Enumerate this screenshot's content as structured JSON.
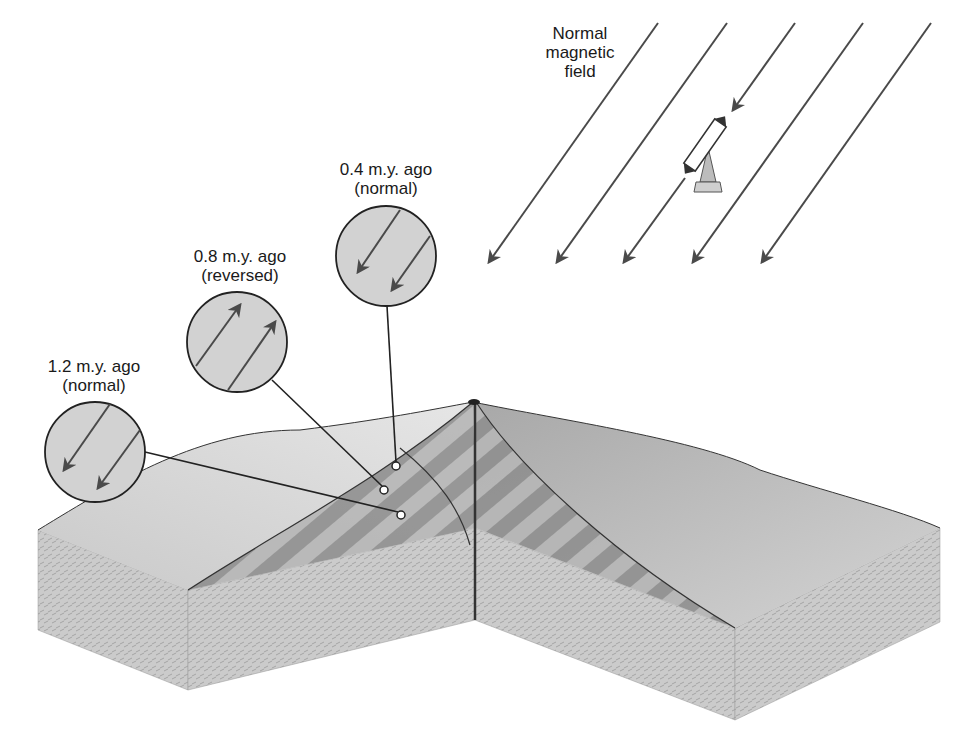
{
  "title_label": {
    "line1": "Normal",
    "line2": "magnetic",
    "line3": "field"
  },
  "samples": [
    {
      "age": "0.4 m.y. ago",
      "polarity": "(normal)",
      "direction": "down-left"
    },
    {
      "age": "0.8 m.y. ago",
      "polarity": "(reversed)",
      "direction": "up-right"
    },
    {
      "age": "1.2 m.y. ago",
      "polarity": "(normal)",
      "direction": "down-left"
    }
  ],
  "field_arrows": {
    "count": 5,
    "direction": "down-left"
  },
  "compass": {
    "name": "compass-needle",
    "orientation": "aligned-with-field"
  },
  "colors": {
    "line": "#4a4a4a",
    "circle_fill": "#d2d2d2",
    "stripe_dark": "#8a8a8a",
    "stripe_light": "#b4b4b4",
    "block_side": "#c8c8c8",
    "surface": "#e0e0e0"
  }
}
